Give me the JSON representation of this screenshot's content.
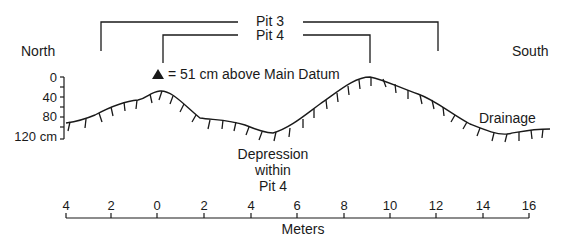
{
  "directions": {
    "left": "North",
    "right": "South"
  },
  "brackets": [
    {
      "label": "Pit 3",
      "x_start_m": -2.5,
      "x_end_m": 12
    },
    {
      "label": "Pit 4",
      "x_start_m": 0,
      "x_end_m": 9
    }
  ],
  "legend": {
    "symbol": "triangle",
    "text": "= 51 cm above Main Datum"
  },
  "annotations": {
    "depression": [
      "Depression",
      "within",
      "Pit 4"
    ],
    "drainage": "Drainage"
  },
  "y_axis": {
    "ticks": [
      "0",
      "40",
      "80",
      "120 cm"
    ],
    "unit": "cm"
  },
  "x_axis": {
    "title": "Meters",
    "ticks": [
      "4",
      "2",
      "0",
      "2",
      "4",
      "6",
      "8",
      "10",
      "12",
      "14",
      "16"
    ]
  },
  "colors": {
    "ink": "#1a1a1a",
    "background": "#ffffff"
  }
}
